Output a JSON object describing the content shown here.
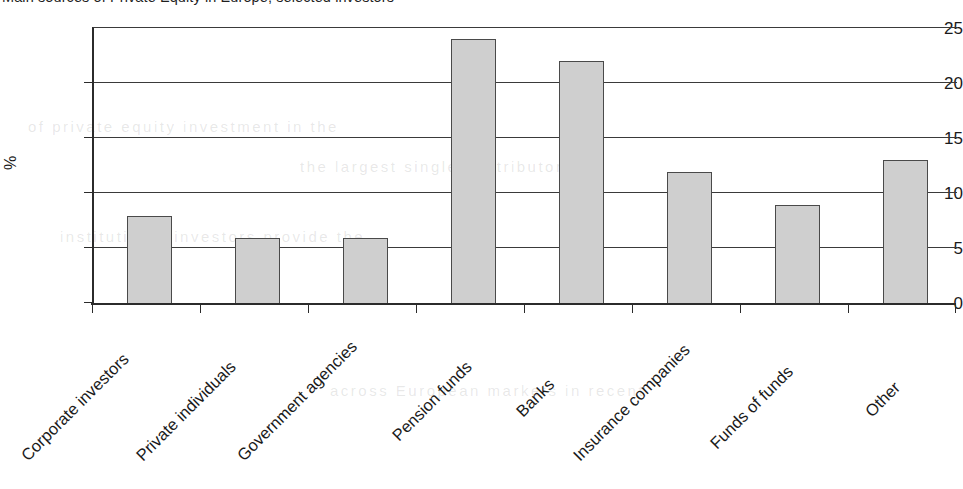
{
  "chart_data": {
    "type": "bar",
    "title": "Main sources of Private Equity in Europe, selected investors",
    "xlabel": "",
    "ylabel": "%",
    "ylim": [
      0,
      25
    ],
    "yticks": [
      0,
      5,
      10,
      15,
      20,
      25
    ],
    "grid": true,
    "legend": false,
    "categories": [
      "Corporate investors",
      "Private individuals",
      "Government agencies",
      "Pension funds",
      "Banks",
      "Insurance companies",
      "Funds of funds",
      "Other"
    ],
    "values": [
      8,
      6,
      6,
      24,
      22,
      12,
      9,
      13
    ],
    "series": [
      {
        "name": "Share of total",
        "values": [
          8,
          6,
          6,
          24,
          22,
          12,
          9,
          13
        ]
      }
    ],
    "colors": {
      "bar_fill": "#cfcfcf",
      "bar_border": "#4a4a4a",
      "axis": "#2b2b2b",
      "gridline": "#3a3a3a",
      "text": "#1a1a1a",
      "background": "#ffffff"
    }
  },
  "ytick_labels": [
    "25",
    "20",
    "15",
    "10",
    "5",
    "0"
  ],
  "background_bleed": [
    "of private equity investment in the",
    "the largest single contributor and",
    "institutional investors provide the",
    "across European markets in recent"
  ]
}
